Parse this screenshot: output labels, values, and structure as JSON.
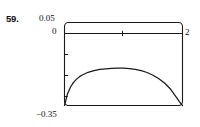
{
  "figure": {
    "problem_number": "59.",
    "labels": {
      "y_max": "0.05",
      "y_zero": "0",
      "y_min": "−0.35",
      "x_max": "2"
    }
  },
  "chart_data": {
    "type": "line",
    "title": "",
    "subtitle": "",
    "xlabel": "",
    "ylabel": "",
    "xlim": [
      0,
      2
    ],
    "ylim": [
      -0.35,
      0.05
    ],
    "grid": false,
    "legend": null,
    "frame": "box",
    "axis_tick_labels": {
      "y": [
        "0.05",
        "0",
        "−0.35"
      ],
      "x": [
        "2"
      ]
    },
    "y_ticks": [
      0.05,
      0.0,
      -0.1,
      -0.2,
      -0.35
    ],
    "x_ticks": [
      1.0,
      2.0
    ],
    "zero_line": {
      "y": 0.0,
      "drawn": true,
      "tick_at_x": 1.0
    },
    "annotations": [],
    "series": [
      {
        "name": "curve",
        "x": [
          0.0,
          0.05,
          0.1,
          0.15,
          0.2,
          0.25,
          0.3,
          0.4,
          0.5,
          0.6,
          0.7,
          0.8,
          0.9,
          1.0,
          1.1,
          1.2,
          1.3,
          1.4,
          1.5,
          1.6,
          1.7,
          1.8,
          1.9,
          1.95,
          2.0
        ],
        "y": [
          -0.35,
          -0.295,
          -0.262,
          -0.24,
          -0.224,
          -0.212,
          -0.203,
          -0.19,
          -0.182,
          -0.176,
          -0.173,
          -0.171,
          -0.17,
          -0.17,
          -0.172,
          -0.176,
          -0.182,
          -0.191,
          -0.204,
          -0.221,
          -0.243,
          -0.272,
          -0.312,
          -0.332,
          -0.35
        ]
      }
    ]
  }
}
